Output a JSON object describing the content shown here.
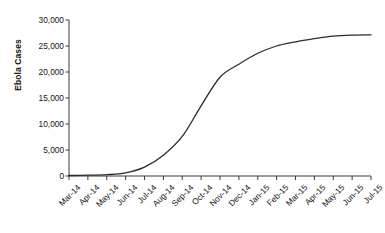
{
  "chart_data": {
    "type": "line",
    "title": "",
    "xlabel": "",
    "ylabel": "Ebola Cases",
    "ylim": [
      0,
      30000
    ],
    "ytick_labels": [
      "30,000",
      "25,000",
      "20,000",
      "15,000",
      "10,000",
      "5,000",
      "0"
    ],
    "ytick_values": [
      30000,
      25000,
      20000,
      15000,
      10000,
      5000,
      0
    ],
    "grid": false,
    "legend": "none",
    "categories": [
      "Mar-14",
      "Apr-14",
      "May-14",
      "Jun-14",
      "Jul-14",
      "Aug-14",
      "Sep-14",
      "Oct-14",
      "Nov-14",
      "Dec-14",
      "Jan-15",
      "Feb-15",
      "Mar-15",
      "Apr-15",
      "May-15",
      "Jun-15",
      "Jul-15"
    ],
    "values": [
      100,
      150,
      250,
      600,
      1700,
      4000,
      7600,
      13500,
      19000,
      21500,
      23600,
      25000,
      25800,
      26400,
      26900,
      27100,
      27150
    ],
    "series": [
      {
        "name": "Cumulative Ebola Cases",
        "color": "#2b2b2b",
        "values": [
          100,
          150,
          250,
          600,
          1700,
          4000,
          7600,
          13500,
          19000,
          21500,
          23600,
          25000,
          25800,
          26400,
          26900,
          27100,
          27150
        ]
      }
    ]
  },
  "axis": {
    "y_title": "Ebola Cases",
    "axis_color": "#3a3a3a",
    "line_color": "#2b2b2b"
  }
}
